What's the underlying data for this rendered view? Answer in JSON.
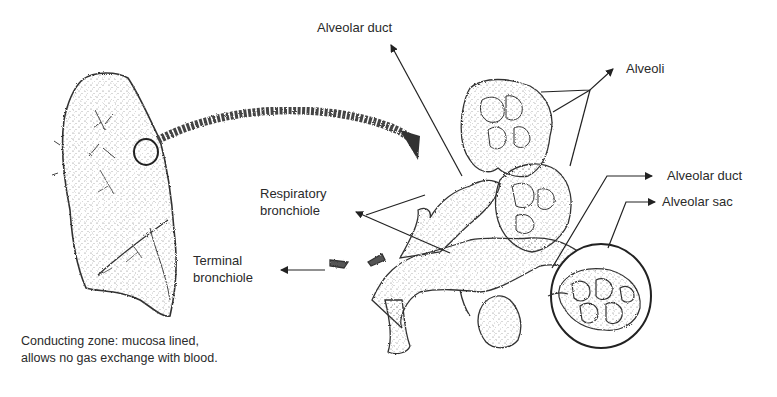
{
  "diagram": {
    "labels": {
      "alveolar_duct_top": "Alveolar duct",
      "alveoli": "Alveoli",
      "alveolar_duct_right": "Alveolar duct",
      "alveolar_sac": "Alveolar sac",
      "respiratory_bronchiole_line1": "Respiratory",
      "respiratory_bronchiole_line2": "bronchiole",
      "terminal_bronchiole_line1": "Terminal",
      "terminal_bronchiole_line2": "bronchiole"
    },
    "caption": {
      "line1": "Conducting zone: mucosa lined,",
      "line2": "allows no gas exchange with blood."
    },
    "elements": {
      "lung": "lung-outline-drawing",
      "magnifier_circle": "magnify-circle",
      "curved_arrow": "curved-zoom-arrow",
      "bronchial_tree": "bronchiole-alveoli-drawing",
      "sac_inset": "alveolar-sac-inset-circle"
    },
    "colors": {
      "ink": "#222222",
      "stipple": "#555555",
      "background": "#ffffff"
    }
  }
}
